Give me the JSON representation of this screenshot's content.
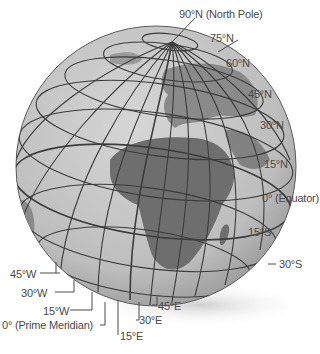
{
  "diagram": {
    "colors": {
      "ocean": "#c4c4c4",
      "land": "#7a7a7a",
      "grid": "#3c3c3c",
      "label": "#4a4a4a",
      "shadow": "#d8d8d8"
    },
    "latitude_labels": {
      "north_pole": "90°N (North Pole)",
      "n75": "75°N",
      "n60": "60°N",
      "n45": "45°N",
      "n30": "30°N",
      "n15": "15°N",
      "equator": "0° (Equator)",
      "s15": "15°S",
      "s30": "30°S"
    },
    "longitude_labels": {
      "w45": "45°W",
      "w30": "30°W",
      "w15": "15°W",
      "prime_meridian": "0° (Prime Meridian)",
      "e15": "15°E",
      "e30": "30°E",
      "e45": "45°E"
    }
  }
}
